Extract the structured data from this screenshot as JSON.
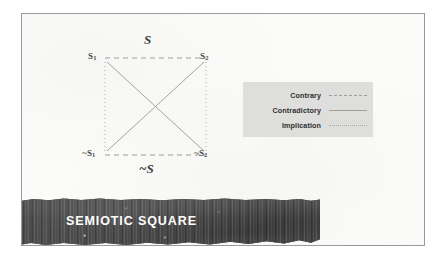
{
  "figure": {
    "banner_title": "SEMIOTIC SQUARE",
    "top_axis_label": "S",
    "bottom_axis_label": "~S",
    "vertices": [
      {
        "id": "s1",
        "label": "S",
        "subscript": "1",
        "prefix": "",
        "position": "top-left"
      },
      {
        "id": "s2",
        "label": "S",
        "subscript": "2",
        "prefix": "",
        "position": "top-right"
      },
      {
        "id": "ns1",
        "label": "S",
        "subscript": "1",
        "prefix": "~",
        "position": "bottom-left"
      },
      {
        "id": "ns2",
        "label": "S",
        "subscript": "2",
        "prefix": "~",
        "position": "bottom-right"
      }
    ],
    "legend": {
      "items": [
        {
          "label": "Contrary",
          "line_style": "dashed"
        },
        {
          "label": "Contradictory",
          "line_style": "solid"
        },
        {
          "label": "Implication",
          "line_style": "dotted"
        }
      ],
      "background_color": "#dededd"
    },
    "edges": [
      {
        "from": "s1",
        "to": "s2",
        "relation": "Contrary",
        "line_style": "dashed"
      },
      {
        "from": "ns1",
        "to": "ns2",
        "relation": "Contrary",
        "line_style": "dashed"
      },
      {
        "from": "s1",
        "to": "ns2",
        "relation": "Contradictory",
        "line_style": "solid"
      },
      {
        "from": "s2",
        "to": "ns1",
        "relation": "Contradictory",
        "line_style": "solid"
      },
      {
        "from": "s1",
        "to": "ns1",
        "relation": "Implication",
        "line_style": "dotted"
      },
      {
        "from": "s2",
        "to": "ns2",
        "relation": "Implication",
        "line_style": "dotted"
      }
    ],
    "colors": {
      "frame": "#9a9a9a",
      "line": "#9d9d9d",
      "banner": "#484848",
      "banner_text": "#ffffff"
    }
  }
}
